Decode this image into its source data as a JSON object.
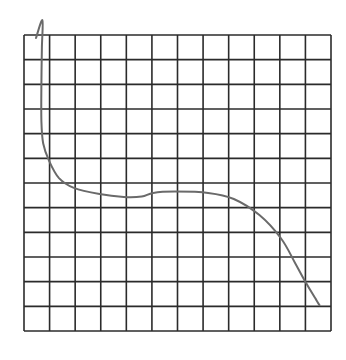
{
  "chart_data": {
    "type": "line",
    "title": "",
    "xlabel": "",
    "ylabel": "",
    "grid": true,
    "grid_cols": 12,
    "grid_rows": 12,
    "xlim": [
      0,
      12
    ],
    "ylim": [
      0,
      12
    ],
    "legend": null,
    "series": [
      {
        "name": "hand-drawn curve",
        "color": "#6a6a6a",
        "points": [
          [
            0.47,
            11.88
          ],
          [
            0.72,
            12.6
          ],
          [
            0.7,
            11.5
          ],
          [
            0.68,
            10.0
          ],
          [
            0.68,
            8.5
          ],
          [
            0.75,
            7.6
          ],
          [
            0.98,
            6.9
          ],
          [
            1.37,
            6.2
          ],
          [
            1.95,
            5.8
          ],
          [
            2.95,
            5.55
          ],
          [
            3.9,
            5.43
          ],
          [
            4.6,
            5.45
          ],
          [
            5.05,
            5.6
          ],
          [
            5.9,
            5.65
          ],
          [
            7.2,
            5.6
          ],
          [
            8.2,
            5.35
          ],
          [
            9.2,
            4.7
          ],
          [
            10.05,
            3.75
          ],
          [
            10.6,
            2.75
          ],
          [
            11.05,
            1.9
          ],
          [
            11.4,
            1.3
          ],
          [
            11.55,
            1.05
          ]
        ]
      }
    ]
  },
  "colors": {
    "grid": "#2b2b2b",
    "curve": "#6a6a6a",
    "background": "#ffffff"
  }
}
